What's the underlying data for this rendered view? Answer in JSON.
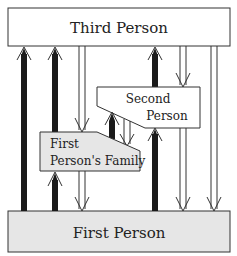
{
  "diagram": {
    "nodes": [
      {
        "id": "third",
        "label": "Third Person",
        "fill": "#ffffff"
      },
      {
        "id": "second",
        "line1": "Second",
        "line2": "Person",
        "fill": "#ffffff"
      },
      {
        "id": "family",
        "line1": "First",
        "line2": "Person's Family",
        "fill": "#e6e6e6"
      },
      {
        "id": "first",
        "label": "First Person",
        "fill": "#e6e6e6"
      }
    ],
    "edges": [
      {
        "from": "first",
        "to": "third",
        "style": "thick-solid"
      },
      {
        "from": "first",
        "to": "third",
        "style": "thick-solid"
      },
      {
        "from": "third",
        "to": "family",
        "style": "hollow"
      },
      {
        "from": "first",
        "to": "third",
        "style": "thick-solid"
      },
      {
        "from": "third",
        "to": "second",
        "style": "hollow"
      },
      {
        "from": "third",
        "to": "first",
        "style": "hollow"
      },
      {
        "from": "family",
        "to": "second",
        "style": "thick-solid"
      },
      {
        "from": "second",
        "to": "family",
        "style": "hollow"
      },
      {
        "from": "first",
        "to": "family",
        "style": "thick-solid"
      },
      {
        "from": "family",
        "to": "first",
        "style": "hollow"
      },
      {
        "from": "second",
        "to": "first",
        "style": "hollow"
      }
    ],
    "colors": {
      "stroke": "#333333",
      "thick_arrow": "#1a1a1a",
      "gray_fill": "#e6e6e6"
    }
  }
}
